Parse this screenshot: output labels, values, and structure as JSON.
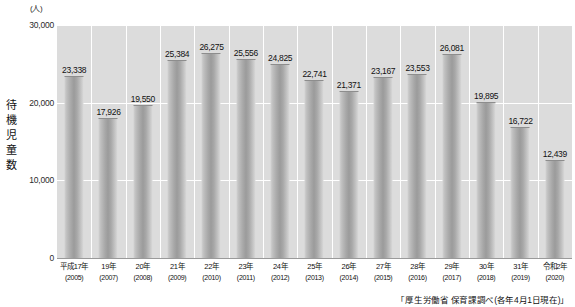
{
  "chart_data": {
    "type": "bar",
    "title": "",
    "unit_label": "(人)",
    "ylabel": "待機児童数",
    "xlabel": "",
    "ylim": [
      0,
      30000
    ],
    "yticks": [
      0,
      10000,
      20000,
      30000
    ],
    "ytick_labels": [
      "0",
      "10,000",
      "20,000",
      "30,000"
    ],
    "grid": true,
    "legend": "none",
    "source": "「厚生労働省 保育課調べ(各年4月1日現在)」",
    "categories": [
      "平成17年",
      "19年",
      "20年",
      "21年",
      "22年",
      "23年",
      "24年",
      "25年",
      "26年",
      "27年",
      "28年",
      "29年",
      "30年",
      "31年",
      "令和2年"
    ],
    "western_years": [
      "(2005)",
      "(2007)",
      "(2008)",
      "(2009)",
      "(2010)",
      "(2011)",
      "(2012)",
      "(2013)",
      "(2014)",
      "(2015)",
      "(2016)",
      "(2017)",
      "(2018)",
      "(2019)",
      "(2020)"
    ],
    "values": [
      23338,
      17926,
      19550,
      25384,
      26275,
      25556,
      24825,
      22741,
      21371,
      23167,
      23553,
      26081,
      19895,
      16722,
      12439
    ],
    "value_labels": [
      "23,338",
      "17,926",
      "19,550",
      "25,384",
      "26,275",
      "25,556",
      "24,825",
      "22,741",
      "21,371",
      "23,167",
      "23,553",
      "26,081",
      "19,895",
      "16,722",
      "12,439"
    ]
  },
  "colors": {
    "plot_background": "#dcdcdc",
    "gridline": "#ffffff",
    "bar": "#a8a8a8",
    "text": "#111111",
    "page_background": "#ffffff"
  }
}
